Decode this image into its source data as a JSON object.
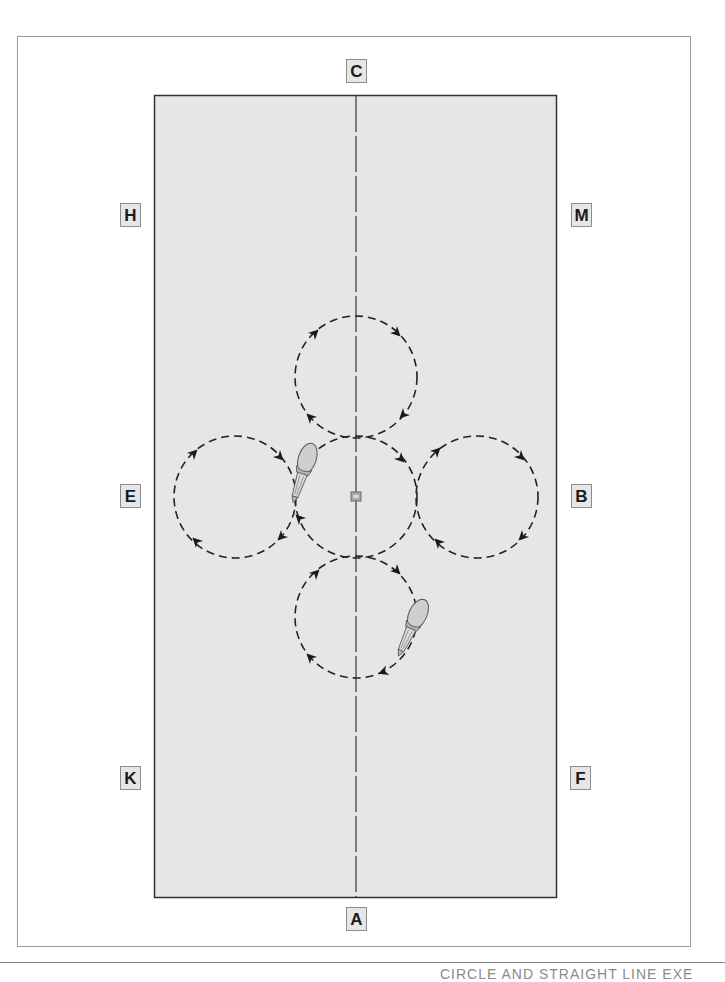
{
  "diagram": {
    "type": "dressage-arena-figure",
    "arena": {
      "fill": "#e6e6e6",
      "border": "#333333",
      "centerline_color": "#444444"
    },
    "markers": [
      {
        "letter": "C",
        "position": "top-center"
      },
      {
        "letter": "H",
        "position": "left-upper"
      },
      {
        "letter": "M",
        "position": "right-upper"
      },
      {
        "letter": "E",
        "position": "left-middle"
      },
      {
        "letter": "B",
        "position": "right-middle"
      },
      {
        "letter": "K",
        "position": "left-lower"
      },
      {
        "letter": "F",
        "position": "right-lower"
      },
      {
        "letter": "A",
        "position": "bottom-center"
      }
    ],
    "circles": [
      {
        "name": "top",
        "direction": "clockwise"
      },
      {
        "name": "left",
        "direction": "clockwise"
      },
      {
        "name": "center",
        "direction": "clockwise"
      },
      {
        "name": "right",
        "direction": "clockwise"
      },
      {
        "name": "bottom",
        "direction": "clockwise"
      }
    ],
    "riders": [
      {
        "circle": "left",
        "heading": "down"
      },
      {
        "circle": "bottom",
        "heading": "down-left"
      }
    ],
    "center_marker": "X"
  },
  "footer": {
    "caption": "CIRCLE AND STRAIGHT LINE EXE"
  }
}
